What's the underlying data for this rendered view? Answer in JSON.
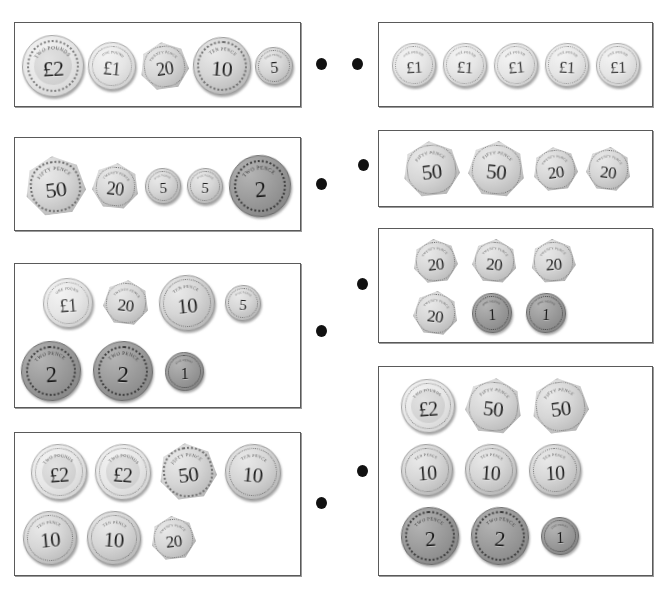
{
  "page": {
    "background": "#ffffff",
    "box_border_color": "#5a5a5a",
    "dot_color": "#111111"
  },
  "legend": {
    "rim_text_pound2": "TWO POUNDS",
    "rim_text_pound1": "ONE POUND",
    "rim_text_50": "FIFTY PENCE",
    "rim_text_20": "TWENTY PENCE",
    "rim_text_10": "TEN PENCE",
    "rim_text_5": "FIVE PENCE",
    "rim_text_2": "TWO PENCE",
    "rim_text_1": "ONE PENNY"
  },
  "left_boxes": [
    {
      "id": "left-box-1",
      "rect": {
        "x": 14,
        "y": 22,
        "w": 287,
        "h": 85
      },
      "rows": [
        {
          "y": 8,
          "h": 70,
          "gap": 4,
          "coins": [
            {
              "label": "£2",
              "rim": "TWO POUNDS",
              "metal": "bimetal",
              "shape": "round",
              "size": 62,
              "font": 22,
              "rot": -3
            },
            {
              "label": "£1",
              "rim": "ONE POUND",
              "metal": "pale",
              "shape": "round",
              "size": 48,
              "font": 18,
              "rot": 5
            },
            {
              "label": "20",
              "rim": "TWENTY PENCE",
              "metal": "silver",
              "shape": "hept",
              "size": 49,
              "font": 18,
              "rot": -8
            },
            {
              "label": "10",
              "rim": "TEN PENCE",
              "metal": "silver",
              "shape": "round",
              "size": 58,
              "font": 22,
              "rot": 4
            },
            {
              "label": "5",
              "rim": "FIVE PENCE",
              "metal": "silver",
              "shape": "round",
              "size": 38,
              "font": 16,
              "rot": -4
            }
          ]
        }
      ]
    },
    {
      "id": "left-box-2",
      "rect": {
        "x": 14,
        "y": 137,
        "w": 287,
        "h": 94
      },
      "rows": [
        {
          "y": 12,
          "h": 72,
          "gap": 6,
          "coins": [
            {
              "label": "50",
              "rim": "FIFTY PENCE",
              "metal": "silver",
              "shape": "hept",
              "size": 61,
              "font": 22,
              "rot": -7
            },
            {
              "label": "20",
              "rim": "TWENTY PENCE",
              "metal": "silver",
              "shape": "hept",
              "size": 47,
              "font": 18,
              "rot": 6
            },
            {
              "label": "5",
              "rim": "FIVE PENCE",
              "metal": "silver",
              "shape": "round",
              "size": 36,
              "font": 15,
              "rot": -3
            },
            {
              "label": "5",
              "rim": "FIVE PENCE",
              "metal": "silver",
              "shape": "round",
              "size": 36,
              "font": 15,
              "rot": 3
            },
            {
              "label": "2",
              "rim": "TWO PENCE",
              "metal": "copper",
              "shape": "round",
              "size": 62,
              "font": 23,
              "rot": -5
            }
          ]
        }
      ]
    },
    {
      "id": "left-box-3",
      "rect": {
        "x": 14,
        "y": 263,
        "w": 287,
        "h": 145
      },
      "rows": [
        {
          "y": 8,
          "h": 62,
          "gap": 10,
          "indent": 28,
          "coins": [
            {
              "label": "£1",
              "rim": "ONE POUND",
              "metal": "pale",
              "shape": "round",
              "size": 50,
              "font": 18,
              "rot": -4
            },
            {
              "label": "20",
              "rim": "TWENTY PENCE",
              "metal": "silver",
              "shape": "hept",
              "size": 46,
              "font": 17,
              "rot": 6
            },
            {
              "label": "10",
              "rim": "TEN PENCE",
              "metal": "silver",
              "shape": "round",
              "size": 56,
              "font": 21,
              "rot": -5
            },
            {
              "label": "5",
              "rim": "FIVE PENCE",
              "metal": "silver",
              "shape": "round",
              "size": 36,
              "font": 15,
              "rot": 4
            }
          ]
        },
        {
          "y": 74,
          "h": 66,
          "gap": 12,
          "indent": 6,
          "coins": [
            {
              "label": "2",
              "rim": "TWO PENCE",
              "metal": "copper",
              "shape": "round",
              "size": 60,
              "font": 23,
              "rot": -4
            },
            {
              "label": "2",
              "rim": "TWO PENCE",
              "metal": "copper",
              "shape": "round",
              "size": 60,
              "font": 23,
              "rot": 3
            },
            {
              "label": "1",
              "rim": "ONE PENNY",
              "metal": "copper",
              "shape": "round",
              "size": 39,
              "font": 16,
              "rot": -2
            }
          ]
        }
      ]
    },
    {
      "id": "left-box-4",
      "rect": {
        "x": 14,
        "y": 432,
        "w": 287,
        "h": 144
      },
      "rows": [
        {
          "y": 8,
          "h": 62,
          "gap": 8,
          "indent": 16,
          "coins": [
            {
              "label": "£2",
              "rim": "TWO POUNDS",
              "metal": "bimetal",
              "shape": "round",
              "size": 56,
              "font": 20,
              "rot": -4
            },
            {
              "label": "£2",
              "rim": "TWO POUNDS",
              "metal": "bimetal",
              "shape": "round",
              "size": 56,
              "font": 20,
              "rot": 4
            },
            {
              "label": "50",
              "rim": "FIFTY PENCE",
              "metal": "silver",
              "shape": "hept",
              "size": 58,
              "font": 21,
              "rot": -7
            },
            {
              "label": "10",
              "rim": "TEN PENCE",
              "metal": "silver",
              "shape": "round",
              "size": 56,
              "font": 21,
              "rot": 5
            }
          ]
        },
        {
          "y": 74,
          "h": 62,
          "gap": 10,
          "indent": 8,
          "coins": [
            {
              "label": "10",
              "rim": "TEN PENCE",
              "metal": "silver",
              "shape": "round",
              "size": 54,
              "font": 21,
              "rot": -5
            },
            {
              "label": "10",
              "rim": "TEN PENCE",
              "metal": "silver",
              "shape": "round",
              "size": 54,
              "font": 21,
              "rot": 4
            },
            {
              "label": "20",
              "rim": "TWENTY PENCE",
              "metal": "silver",
              "shape": "hept",
              "size": 45,
              "font": 17,
              "rot": -6
            }
          ]
        }
      ]
    }
  ],
  "right_boxes": [
    {
      "id": "right-box-1",
      "rect": {
        "x": 378,
        "y": 22,
        "w": 275,
        "h": 85
      },
      "rows": [
        {
          "y": 12,
          "h": 60,
          "gap": 7,
          "coins": [
            {
              "label": "£1",
              "rim": "ONE POUND",
              "metal": "pale",
              "shape": "round",
              "size": 44,
              "font": 17,
              "rot": -3
            },
            {
              "label": "£1",
              "rim": "ONE POUND",
              "metal": "pale",
              "shape": "round",
              "size": 44,
              "font": 17,
              "rot": 4
            },
            {
              "label": "£1",
              "rim": "ONE POUND",
              "metal": "pale",
              "shape": "round",
              "size": 44,
              "font": 17,
              "rot": -5
            },
            {
              "label": "£1",
              "rim": "ONE POUND",
              "metal": "pale",
              "shape": "round",
              "size": 44,
              "font": 17,
              "rot": 3
            },
            {
              "label": "£1",
              "rim": "ONE POUND",
              "metal": "pale",
              "shape": "round",
              "size": 44,
              "font": 17,
              "rot": -2
            }
          ]
        }
      ]
    },
    {
      "id": "right-box-2",
      "rect": {
        "x": 378,
        "y": 130,
        "w": 275,
        "h": 77
      },
      "rows": [
        {
          "y": 6,
          "h": 64,
          "gap": 8,
          "indent": 24,
          "coins": [
            {
              "label": "50",
              "rim": "FIFTY PENCE",
              "metal": "silver",
              "shape": "hept",
              "size": 57,
              "font": 21,
              "rot": -6
            },
            {
              "label": "50",
              "rim": "FIFTY PENCE",
              "metal": "silver",
              "shape": "hept",
              "size": 57,
              "font": 21,
              "rot": 5
            },
            {
              "label": "20",
              "rim": "TWENTY PENCE",
              "metal": "silver",
              "shape": "hept",
              "size": 45,
              "font": 17,
              "rot": -7
            },
            {
              "label": "20",
              "rim": "TWENTY PENCE",
              "metal": "silver",
              "shape": "hept",
              "size": 45,
              "font": 17,
              "rot": 6
            }
          ]
        }
      ]
    },
    {
      "id": "right-box-3",
      "rect": {
        "x": 378,
        "y": 228,
        "w": 275,
        "h": 115
      },
      "rows": [
        {
          "y": 6,
          "h": 52,
          "gap": 14,
          "indent": 34,
          "coins": [
            {
              "label": "20",
              "rim": "TWENTY PENCE",
              "metal": "silver",
              "shape": "hept",
              "size": 45,
              "font": 17,
              "rot": -6
            },
            {
              "label": "20",
              "rim": "TWENTY PENCE",
              "metal": "silver",
              "shape": "hept",
              "size": 45,
              "font": 17,
              "rot": 5
            },
            {
              "label": "20",
              "rim": "TWENTY PENCE",
              "metal": "silver",
              "shape": "hept",
              "size": 45,
              "font": 17,
              "rot": -4
            }
          ]
        },
        {
          "y": 58,
          "h": 52,
          "gap": 14,
          "indent": 34,
          "coins": [
            {
              "label": "20",
              "rim": "TWENTY PENCE",
              "metal": "silver",
              "shape": "hept",
              "size": 45,
              "font": 17,
              "rot": 6
            },
            {
              "label": "1",
              "rim": "ONE PENNY",
              "metal": "copper",
              "shape": "round",
              "size": 40,
              "font": 16,
              "rot": -3
            },
            {
              "label": "1",
              "rim": "ONE PENNY",
              "metal": "copper",
              "shape": "round",
              "size": 40,
              "font": 16,
              "rot": 3
            }
          ]
        }
      ]
    },
    {
      "id": "right-box-4",
      "rect": {
        "x": 378,
        "y": 366,
        "w": 275,
        "h": 210
      },
      "rows": [
        {
          "y": 8,
          "h": 62,
          "gap": 10,
          "indent": 22,
          "coins": [
            {
              "label": "£2",
              "rim": "TWO POUNDS",
              "metal": "bimetal",
              "shape": "round",
              "size": 54,
              "font": 20,
              "rot": -4
            },
            {
              "label": "50",
              "rim": "FIFTY PENCE",
              "metal": "silver",
              "shape": "hept",
              "size": 57,
              "font": 21,
              "rot": 6
            },
            {
              "label": "50",
              "rim": "FIFTY PENCE",
              "metal": "silver",
              "shape": "hept",
              "size": 57,
              "font": 21,
              "rot": -7
            }
          ]
        },
        {
          "y": 74,
          "h": 58,
          "gap": 12,
          "indent": 22,
          "coins": [
            {
              "label": "10",
              "rim": "TEN PENCE",
              "metal": "silver",
              "shape": "round",
              "size": 52,
              "font": 20,
              "rot": -4
            },
            {
              "label": "10",
              "rim": "TEN PENCE",
              "metal": "silver",
              "shape": "round",
              "size": 52,
              "font": 20,
              "rot": 4
            },
            {
              "label": "10",
              "rim": "TEN PENCE",
              "metal": "silver",
              "shape": "round",
              "size": 52,
              "font": 20,
              "rot": -3
            }
          ]
        },
        {
          "y": 136,
          "h": 66,
          "gap": 12,
          "indent": 22,
          "coins": [
            {
              "label": "2",
              "rim": "TWO PENCE",
              "metal": "copper",
              "shape": "round",
              "size": 58,
              "font": 22,
              "rot": -4
            },
            {
              "label": "2",
              "rim": "TWO PENCE",
              "metal": "copper",
              "shape": "round",
              "size": 58,
              "font": 22,
              "rot": 4
            },
            {
              "label": "1",
              "rim": "ONE PENNY",
              "metal": "copper",
              "shape": "round",
              "size": 38,
              "font": 16,
              "rot": -2
            }
          ]
        }
      ]
    }
  ],
  "left_dots": [
    {
      "id": "left-dot-1",
      "x": 316,
      "y": 58
    },
    {
      "id": "left-dot-2",
      "x": 316,
      "y": 178
    },
    {
      "id": "left-dot-3",
      "x": 316,
      "y": 325
    },
    {
      "id": "left-dot-4",
      "x": 316,
      "y": 497
    }
  ],
  "right_dots": [
    {
      "id": "right-dot-1",
      "x": 352,
      "y": 58
    },
    {
      "id": "right-dot-2",
      "x": 358,
      "y": 159
    },
    {
      "id": "right-dot-3",
      "x": 357,
      "y": 278
    },
    {
      "id": "right-dot-4",
      "x": 357,
      "y": 465
    }
  ]
}
